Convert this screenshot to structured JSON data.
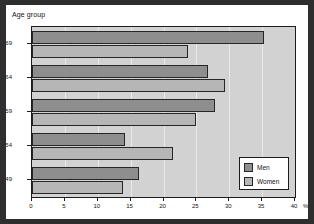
{
  "chart_data": {
    "type": "bar",
    "orientation": "horizontal",
    "title": "Age group",
    "xlabel": "%",
    "ylabel": "Age group",
    "categories": [
      "45-49",
      "50-54",
      "55-59",
      "60-64",
      "65-69"
    ],
    "series": [
      {
        "name": "Men",
        "values": [
          16.2,
          14.1,
          27.9,
          26.8,
          35.3
        ],
        "color": "#8e8e8e"
      },
      {
        "name": "Women",
        "values": [
          13.8,
          21.5,
          25.0,
          29.4,
          23.8
        ],
        "color": "#b6b6b6"
      }
    ],
    "xlim": [
      0,
      40
    ],
    "xticks": [
      0,
      5,
      10,
      15,
      20,
      25,
      30,
      35,
      40
    ],
    "xtick_labels": [
      "0",
      "5",
      "10",
      "15",
      "20",
      "25",
      "30",
      "35",
      "40"
    ],
    "x_unit_label": "%",
    "grid": true,
    "grid_axis": "x",
    "legend_position": "bottom-right",
    "legend_entries": [
      "Men",
      "Women"
    ]
  },
  "colors": {
    "page_border": "#2e2e2e",
    "figure_background": "#ffffff",
    "plot_background": "#d2d2d2",
    "axis": "#1d1d1d",
    "gridline": "#e9e9e9",
    "men": "#8e8e8e",
    "women": "#b6b6b6"
  }
}
